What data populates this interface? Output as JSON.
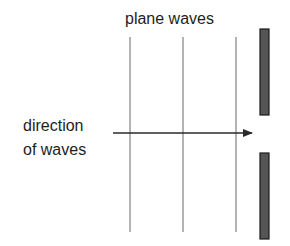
{
  "diagram": {
    "title": "plane waves",
    "direction_label": {
      "line1": "direction",
      "line2": "of waves"
    },
    "wavefronts": [
      {
        "x": 130,
        "y1": 37,
        "y2": 232
      },
      {
        "x": 183,
        "y1": 37,
        "y2": 232
      },
      {
        "x": 236,
        "y1": 37,
        "y2": 232
      }
    ],
    "arrow": {
      "x1": 113,
      "x2": 252,
      "y": 133
    },
    "barriers": [
      {
        "name": "top-barrier",
        "x": 260,
        "y": 29,
        "width": 9,
        "height": 86
      },
      {
        "name": "bottom-barrier",
        "x": 260,
        "y": 153,
        "width": 9,
        "height": 86
      }
    ],
    "colors": {
      "line": "#8a8a8a",
      "arrow": "#2a2a2a",
      "barrier_fill": "#555555",
      "barrier_stroke": "#1a1a1a",
      "text": "#1e1e1e"
    }
  }
}
